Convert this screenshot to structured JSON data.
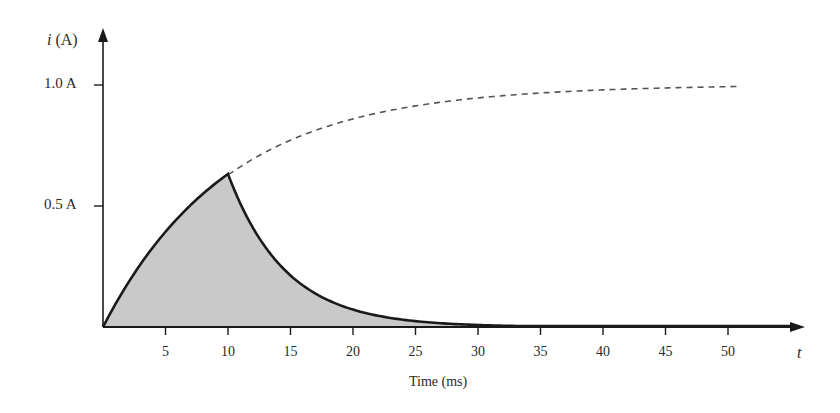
{
  "chart_data": {
    "type": "line",
    "title": "",
    "xlabel": "Time (ms)",
    "ylabel": "i (A)",
    "x_axis_symbol": "t",
    "xlim": [
      0,
      56
    ],
    "ylim": [
      0,
      1.1
    ],
    "grid": false,
    "legend": null,
    "x_ticks": [
      5,
      10,
      15,
      20,
      25,
      30,
      35,
      40,
      45,
      50
    ],
    "y_ticks": [
      {
        "value": 0.5,
        "label": "0.5 A"
      },
      {
        "value": 1.0,
        "label": "1.0 A"
      }
    ],
    "series": [
      {
        "name": "charging current (solid)",
        "style": "solid",
        "x": [
          0,
          2,
          4,
          6,
          8,
          10
        ],
        "values": [
          0,
          0.18,
          0.33,
          0.45,
          0.55,
          0.63
        ]
      },
      {
        "name": "discharging current (solid)",
        "style": "solid",
        "x": [
          10,
          12,
          14,
          15,
          16,
          18,
          20,
          22,
          25,
          30,
          35,
          40,
          45,
          50,
          55
        ],
        "values": [
          0.63,
          0.42,
          0.28,
          0.23,
          0.19,
          0.12,
          0.085,
          0.055,
          0.03,
          0.004,
          0.0,
          0.0,
          0.0,
          0.0,
          0.0
        ]
      },
      {
        "name": "continued charging (dashed)",
        "style": "dashed",
        "x": [
          10,
          15,
          20,
          25,
          30,
          35,
          40,
          45,
          50,
          51
        ],
        "values": [
          0.63,
          0.78,
          0.86,
          0.92,
          0.95,
          0.97,
          0.98,
          0.99,
          0.993,
          0.994
        ]
      }
    ],
    "shaded_region": "area under solid curve from t=0 to t=30",
    "annotations": []
  },
  "labels": {
    "y_axis": "(A)",
    "y_axis_symbol": "i",
    "x_axis_symbol": "t",
    "x_title": "Time (ms)",
    "y_tick_1": "1.0 A",
    "y_tick_05": "0.5 A",
    "x_ticks": [
      "5",
      "10",
      "15",
      "20",
      "25",
      "30",
      "35",
      "40",
      "45",
      "50"
    ]
  },
  "colors": {
    "fill": "#c9c9c9",
    "line": "#1a1a1a",
    "dashed": "#555555"
  }
}
